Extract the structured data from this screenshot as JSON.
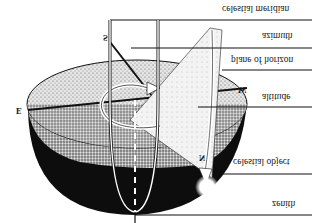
{
  "diagram": {
    "orientation": "vertically flipped",
    "labels": [
      {
        "id": "celestial-meridian",
        "text": "celestial meridian"
      },
      {
        "id": "azimuth",
        "text": "azimuth"
      },
      {
        "id": "plane-of-horizon",
        "text": "plane of horizon"
      },
      {
        "id": "altitude",
        "text": "altitude"
      },
      {
        "id": "celestial-object",
        "text": "celestial object"
      },
      {
        "id": "zenith",
        "text": "zenith"
      }
    ],
    "compass": {
      "south": "S",
      "east": "E",
      "west": "W",
      "north": "N"
    },
    "colors": {
      "background": "#ffffff",
      "ink": "#111111",
      "stipple_light": "#d9d9d9",
      "stipple_mid": "#a8a8a8",
      "bowl_dark": "#0d0d0d"
    }
  }
}
